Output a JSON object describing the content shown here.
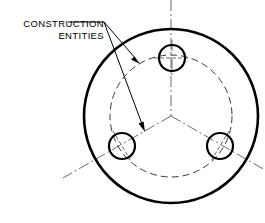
{
  "drawing": {
    "title": "Bolt circle construction geometry",
    "canvas": {
      "width": 265,
      "height": 223,
      "background": "#ffffff"
    },
    "annotation": {
      "name": "construction-entities-callout",
      "line1": "CONSTRUCTION",
      "line2": "ENTITIES",
      "text_anchor_x": 104,
      "line1_y": 27,
      "line2_y": 39,
      "leader_origin": {
        "x": 104,
        "y": 22
      },
      "leader_shoulder": {
        "x": 68,
        "y": 22
      },
      "leaders": [
        {
          "name": "leader-to-bolt-circle",
          "from": {
            "x": 104,
            "y": 22
          },
          "to": {
            "x": 139,
            "y": 63
          },
          "arrow_angle_deg": 49
        },
        {
          "name": "leader-to-center-line",
          "from": {
            "x": 104,
            "y": 22
          },
          "to": {
            "x": 145,
            "y": 130
          },
          "arrow_angle_deg": 69
        }
      ]
    },
    "outer_circle": {
      "name": "outer-plate-circle",
      "cx": 171,
      "cy": 116,
      "r": 87,
      "stroke": "#000000",
      "stroke_width": 2.6,
      "style": "solid"
    },
    "bolt_circle": {
      "name": "bolt-circle-construction",
      "cx": 171,
      "cy": 116,
      "r": 61,
      "stroke": "#3a3a3a",
      "stroke_width": 1,
      "style": "dashed",
      "dash": "7 4"
    },
    "holes": [
      {
        "name": "hole-top",
        "cx": 172,
        "cy": 58,
        "r": 13,
        "stroke": "#000000",
        "stroke_width": 2.2,
        "angle_deg": 90
      },
      {
        "name": "hole-lower-left",
        "cx": 122,
        "cy": 146,
        "r": 13,
        "stroke": "#000000",
        "stroke_width": 2.2,
        "angle_deg": 210
      },
      {
        "name": "hole-lower-right",
        "cx": 220,
        "cy": 146,
        "r": 13,
        "stroke": "#000000",
        "stroke_width": 2.2,
        "angle_deg": 330
      }
    ],
    "center_lines": [
      {
        "name": "center-line-vertical-top",
        "from": {
          "x": 171,
          "y": 0
        },
        "to": {
          "x": 171,
          "y": 116
        },
        "stroke": "#6b6b6b",
        "style": "center",
        "dash": "11 3 2 3"
      },
      {
        "name": "center-line-radial-lower-left",
        "from": {
          "x": 171,
          "y": 116
        },
        "to": {
          "x": 63,
          "y": 178
        },
        "stroke": "#6b6b6b",
        "style": "center",
        "dash": "11 3 2 3"
      },
      {
        "name": "center-line-radial-lower-right",
        "from": {
          "x": 171,
          "y": 116
        },
        "to": {
          "x": 265,
          "y": 170
        },
        "stroke": "#6b6b6b",
        "style": "center",
        "dash": "11 3 2 3"
      }
    ],
    "hole_cross_marks": {
      "name": "hole-center-marks",
      "length": 21,
      "stroke": "#6b6b6b",
      "dash": "4 2"
    }
  }
}
